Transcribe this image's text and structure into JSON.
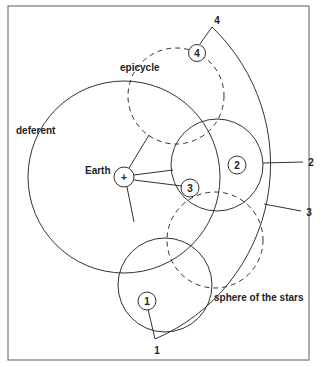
{
  "diagram": {
    "labels": {
      "epicycle": "epicycle",
      "deferent": "deferent",
      "earth": "Earth",
      "earth_symbol": "+",
      "sphere": "sphere of the stars"
    },
    "planet_positions": [
      {
        "id": "1",
        "label": "1"
      },
      {
        "id": "2",
        "label": "2"
      },
      {
        "id": "3",
        "label": "3"
      },
      {
        "id": "4",
        "label": "4"
      }
    ],
    "star_sphere_markers": [
      {
        "id": "1",
        "label": "1"
      },
      {
        "id": "2",
        "label": "2"
      },
      {
        "id": "3",
        "label": "3"
      },
      {
        "id": "4",
        "label": "4"
      }
    ],
    "colors": {
      "line": "#333333",
      "frame": "#777777",
      "background": "#ffffff"
    }
  }
}
